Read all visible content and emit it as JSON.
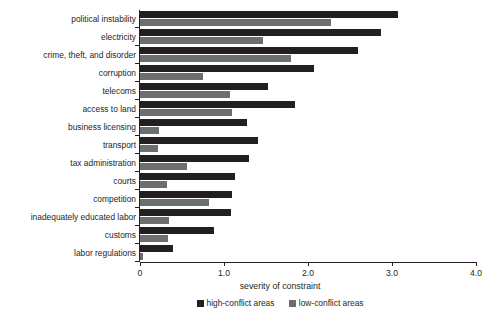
{
  "chart_data": {
    "type": "bar",
    "orientation": "horizontal",
    "title": "",
    "xlabel": "severity of constraint",
    "ylabel": "",
    "xlim": [
      0,
      4.0
    ],
    "xticks": [
      "0",
      "1.0",
      "2.0",
      "3.0",
      "4.0"
    ],
    "xtick_values": [
      0,
      1.0,
      2.0,
      3.0,
      4.0
    ],
    "grid": false,
    "legend_position": "bottom",
    "colors": {
      "high_conflict": "#231f20",
      "low_conflict": "#6d6e71",
      "axis": "#231f20",
      "background": "#ffffff"
    },
    "categories": [
      "political instability",
      "electricity",
      "crime, theft, and disorder",
      "corruption",
      "telecoms",
      "access to land",
      "business licensing",
      "transport",
      "tax administration",
      "courts",
      "competition",
      "inadequately educated labor",
      "customs",
      "labor regulations"
    ],
    "series": [
      {
        "name": "high-conflict areas",
        "color": "#231f20",
        "values": [
          3.07,
          2.87,
          2.59,
          2.07,
          1.52,
          1.85,
          1.27,
          1.4,
          1.3,
          1.13,
          1.1,
          1.08,
          0.88,
          0.39
        ]
      },
      {
        "name": "low-conflict areas",
        "color": "#6d6e71",
        "values": [
          2.27,
          1.47,
          1.8,
          0.75,
          1.07,
          1.1,
          0.23,
          0.21,
          0.56,
          0.32,
          0.82,
          0.35,
          0.33,
          0.03
        ]
      }
    ]
  }
}
